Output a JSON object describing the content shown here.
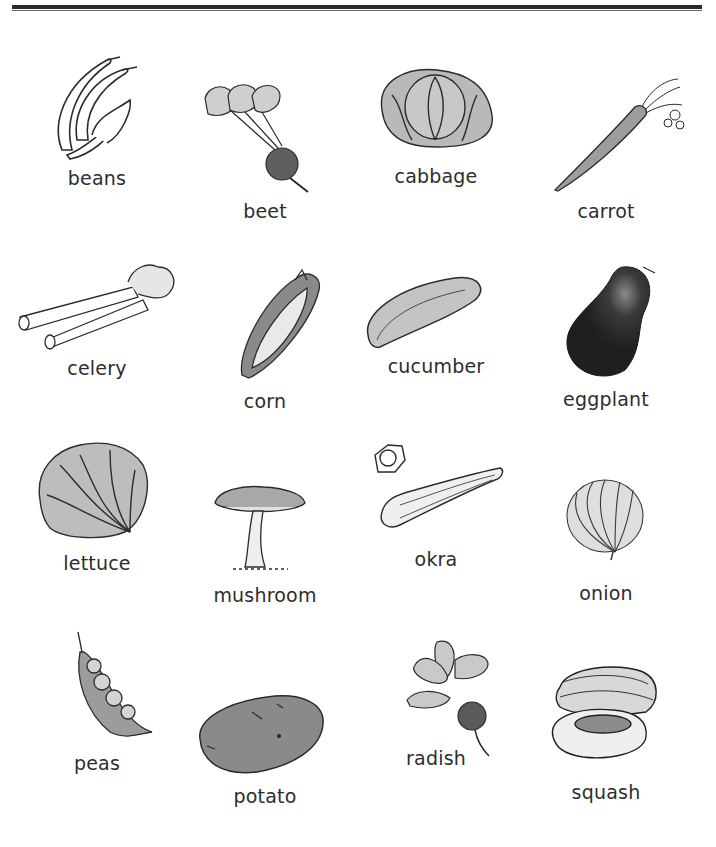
{
  "page": {
    "type": "vocabulary worksheet",
    "header_rule": true
  },
  "vegetables": [
    {
      "id": "beans",
      "label": "beans"
    },
    {
      "id": "beet",
      "label": "beet"
    },
    {
      "id": "cabbage",
      "label": "cabbage"
    },
    {
      "id": "carrot",
      "label": "carrot"
    },
    {
      "id": "celery",
      "label": "celery"
    },
    {
      "id": "corn",
      "label": "corn"
    },
    {
      "id": "cucumber",
      "label": "cucumber"
    },
    {
      "id": "eggplant",
      "label": "eggplant"
    },
    {
      "id": "lettuce",
      "label": "lettuce"
    },
    {
      "id": "mushroom",
      "label": "mushroom"
    },
    {
      "id": "okra",
      "label": "okra"
    },
    {
      "id": "onion",
      "label": "onion"
    },
    {
      "id": "peas",
      "label": "peas"
    },
    {
      "id": "potato",
      "label": "potato"
    },
    {
      "id": "radish",
      "label": "radish"
    },
    {
      "id": "squash",
      "label": "squash"
    }
  ],
  "colors": {
    "ink": "#2b2b2b",
    "fill_light": "#cfcfcf",
    "fill_mid": "#9a9a9a",
    "fill_dark": "#5a5a5a",
    "fill_black": "#262626"
  }
}
